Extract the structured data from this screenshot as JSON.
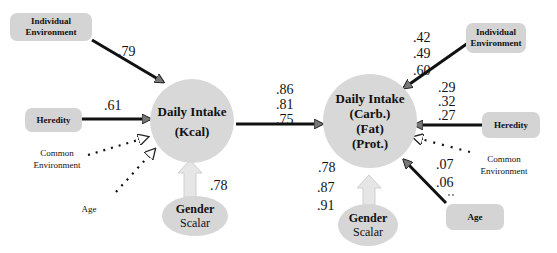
{
  "left_model": {
    "outcome": {
      "line1": "Daily Intake",
      "line2": "(Kcal)"
    },
    "predictors": {
      "individual_environment": {
        "line1": "Individual",
        "line2": "Environment",
        "coef": ".79"
      },
      "heredity": {
        "label": "Heredity",
        "coef": ".61"
      },
      "common_environment": {
        "line1": "Common",
        "line2": "Environment"
      },
      "age": {
        "label": "Age"
      }
    },
    "gender": {
      "line1": "Gender",
      "line2": "Scalar",
      "coef": ".78"
    }
  },
  "link": {
    "coefs": [
      ".86",
      ".81",
      ".75"
    ]
  },
  "right_model": {
    "outcome": {
      "line1": "Daily Intake",
      "line2": "(Carb.)",
      "line3": "(Fat)",
      "line4": "(Prot.)"
    },
    "predictors": {
      "individual_environment": {
        "line1": "Individual",
        "line2": "Environment",
        "coefs": [
          ".42",
          ".49",
          ".60"
        ]
      },
      "heredity": {
        "label": "Heredity",
        "coefs": [
          ".29",
          ".32",
          ".27"
        ]
      },
      "common_environment": {
        "line1": "Common",
        "line2": "Environment",
        "coef": ".07"
      },
      "age": {
        "label": "Age",
        "coef": ".06"
      }
    },
    "gender": {
      "line1": "Gender",
      "line2": "Scalar",
      "coefs": [
        ".78",
        ".87",
        ".91"
      ]
    }
  }
}
